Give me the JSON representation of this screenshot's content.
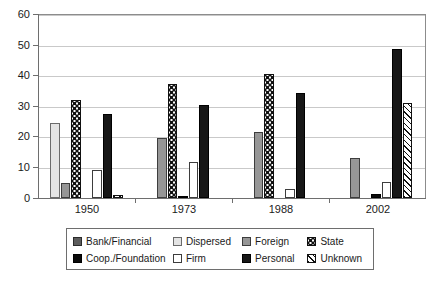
{
  "chart_data": {
    "type": "bar",
    "title": "",
    "subtitle": "",
    "xlabel": "",
    "ylabel": "",
    "categories": [
      "1950",
      "1973",
      "1988",
      "2002"
    ],
    "ylim": [
      0,
      60
    ],
    "yticks": [
      0,
      10,
      20,
      30,
      40,
      50,
      60
    ],
    "grid": true,
    "legend_position": "bottom",
    "series": [
      {
        "name": "Bank/Financial",
        "pattern": "solid-dark-gray",
        "color": "#5c5c5c",
        "values": [
          0,
          0,
          0,
          0
        ]
      },
      {
        "name": "Dispersed",
        "pattern": "solid-light-gray",
        "color": "#e4e4e4",
        "values": [
          24.5,
          0,
          0,
          0
        ]
      },
      {
        "name": "Foreign",
        "pattern": "solid-mid-gray",
        "color": "#969696",
        "values": [
          5,
          19.8,
          21.8,
          13
        ]
      },
      {
        "name": "State",
        "pattern": "dotted-grid",
        "color": "#111111",
        "values": [
          32,
          37.5,
          40.5,
          0
        ]
      },
      {
        "name": "Coop./Foundation",
        "pattern": "solid-black",
        "color": "#0a0a0a",
        "values": [
          0,
          0.4,
          0,
          1.3
        ]
      },
      {
        "name": "Firm",
        "pattern": "white-outline",
        "color": "#ffffff",
        "values": [
          9.3,
          11.7,
          3.1,
          5.2
        ]
      },
      {
        "name": "Personal",
        "pattern": "solid-black",
        "color": "#171717",
        "values": [
          27.7,
          30.5,
          34.3,
          48.8
        ]
      },
      {
        "name": "Unknown",
        "pattern": "diagonal-hatch",
        "color": "#111111",
        "values": [
          1.0,
          0,
          0,
          31.2
        ]
      }
    ]
  },
  "axis": {
    "y_tick_labels": [
      "0",
      "10",
      "20",
      "30",
      "40",
      "50",
      "60"
    ],
    "x_tick_labels": [
      "1950",
      "1973",
      "1988",
      "2002"
    ]
  },
  "legend": {
    "row1": [
      {
        "label": "Bank/Financial",
        "key": "sw-bank"
      },
      {
        "label": "Dispersed",
        "key": "sw-dispersed"
      },
      {
        "label": "Foreign",
        "key": "sw-foreign"
      },
      {
        "label": "State",
        "key": "sw-state"
      }
    ],
    "row2": [
      {
        "label": "Coop./Foundation",
        "key": "sw-coop"
      },
      {
        "label": "Firm",
        "key": "sw-firm"
      },
      {
        "label": "Personal",
        "key": "sw-personal"
      },
      {
        "label": "Unknown",
        "key": "sw-unknown"
      }
    ]
  }
}
